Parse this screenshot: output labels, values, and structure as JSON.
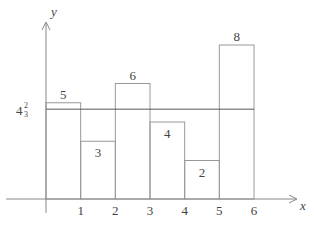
{
  "chart_data": {
    "type": "bar",
    "title": "",
    "xlabel": "x",
    "ylabel": "y",
    "categories": [
      "0-1",
      "1-2",
      "2-3",
      "3-4",
      "4-5",
      "5-6"
    ],
    "values": [
      5,
      3,
      6,
      4,
      2,
      8
    ],
    "bar_labels": [
      "5",
      "3",
      "6",
      "4",
      "2",
      "8"
    ],
    "x_ticks": [
      "1",
      "2",
      "3",
      "4",
      "5",
      "6"
    ],
    "reference_line": {
      "value": 4.6667,
      "label": "4⅔"
    },
    "xlim": [
      0,
      6.8
    ],
    "ylim": [
      0,
      9
    ],
    "grid": false,
    "legend": null
  },
  "axes": {
    "x_label": "x",
    "y_label": "y",
    "mean_label_whole": "4",
    "mean_label_num": "2",
    "mean_label_den": "3"
  },
  "colors": {
    "axis": "#888888",
    "bar_stroke": "#999999",
    "mean_line": "#555555",
    "text": "#444444"
  }
}
